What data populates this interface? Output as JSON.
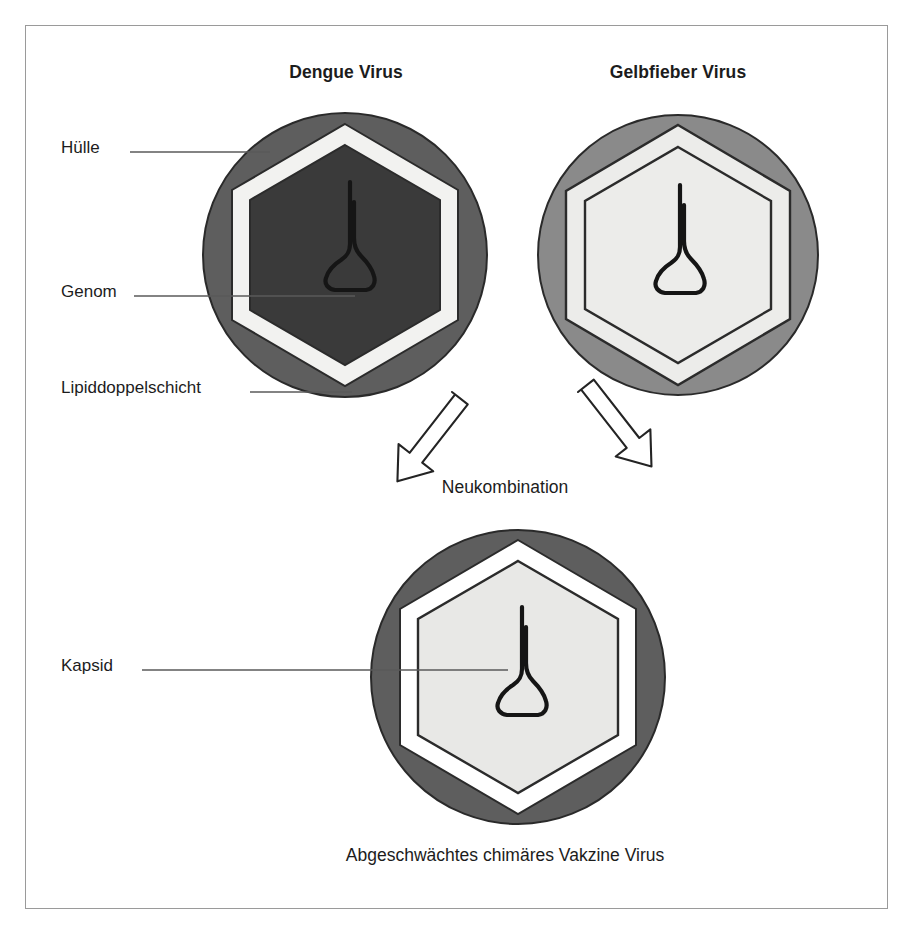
{
  "figure": {
    "kind": "biology-diagram",
    "language": "de"
  },
  "titles": {
    "dengue": "Dengue Virus",
    "yellow_fever": "Gelbfieber Virus"
  },
  "callouts": {
    "envelope": "Hülle",
    "genome": "Genom",
    "lipid_bilayer": "Lipiddoppelschicht",
    "capsid": "Kapsid"
  },
  "process": {
    "recombination": "Neukombination",
    "caption": "Abgeschwächtes chimäres Vakzine Virus"
  },
  "icons": {
    "arrow_left": "arrow-down-right-icon",
    "arrow_right": "arrow-down-left-icon",
    "genome_squiggle": "genome-strand-icon"
  },
  "colors": {
    "frame_border": "#9a9a9a",
    "dengue_envelope": "#5e5e5e",
    "dengue_capsid_fill": "#3a3a3a",
    "lipid_bilayer": "#f2f2f0",
    "yellow_envelope": "#8a8a8a",
    "yellow_interior": "#ececea",
    "outline": "#1a1a1a",
    "text": "#1c1c1c",
    "leader_line": "#5a5a5a"
  },
  "particles": [
    {
      "id": "dengue",
      "name": "Dengue Virus",
      "envelope_color": "#5e5e5e",
      "bilayer_color": "#f2f2f0",
      "capsid_color": "#3a3a3a",
      "center_x": 345,
      "center_y": 255,
      "radius": 142
    },
    {
      "id": "yellow-fever",
      "name": "Gelbfieber Virus",
      "envelope_color": "#8a8a8a",
      "bilayer_color": "#ececea",
      "capsid_color": "#ececea",
      "center_x": 678,
      "center_y": 255,
      "radius": 140
    },
    {
      "id": "chimera",
      "name": "Abgeschwächtes chimäres Vakzine Virus",
      "envelope_color": "#5e5e5e",
      "bilayer_color": "#ffffff",
      "capsid_color": "#e8e8e6",
      "center_x": 518,
      "center_y": 677,
      "radius": 147
    }
  ]
}
